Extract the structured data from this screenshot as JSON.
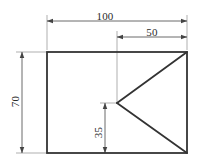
{
  "drawing": {
    "title": "orthographic-part-outline",
    "units": "mm",
    "line_color": "#3a3a3a",
    "dimension_line_color": "#555555",
    "background_color": "#ffffff",
    "outline": {
      "shape": "rectangle",
      "width_value": "100",
      "height_value": "70"
    },
    "interior": {
      "shape": "triangle",
      "apex_offset_from_right": "50",
      "apex_height_from_bottom": "35"
    },
    "dimensions": [
      {
        "name": "overall-width",
        "label": "100",
        "orientation": "horizontal",
        "position": "top"
      },
      {
        "name": "apex-horizontal-offset",
        "label": "50",
        "orientation": "horizontal",
        "position": "top-right"
      },
      {
        "name": "overall-height",
        "label": "70",
        "orientation": "vertical",
        "position": "left"
      },
      {
        "name": "apex-vertical-offset",
        "label": "35",
        "orientation": "vertical",
        "position": "bottom-center"
      }
    ]
  }
}
